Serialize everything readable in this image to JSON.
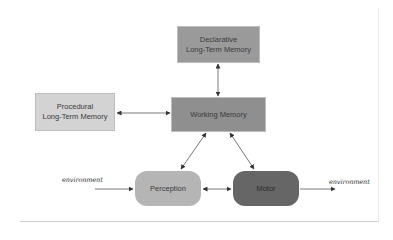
{
  "diagram": {
    "nodes": {
      "declarative": {
        "line1": "Declarative",
        "line2": "Long-Term Memory",
        "color": "#9a9a9a"
      },
      "procedural": {
        "line1": "Procedural",
        "line2": "Long-Term Memory",
        "color": "#d3d3d3"
      },
      "working": {
        "label": "Working Memory",
        "color": "#8f8f8f"
      },
      "perception": {
        "label": "Perception",
        "color": "#b5b5b5"
      },
      "motor": {
        "label": "Motor",
        "color": "#666666"
      }
    },
    "environment_in": "environment",
    "environment_out": "environment",
    "edges": [
      {
        "from": "declarative",
        "to": "working",
        "direction": "both"
      },
      {
        "from": "procedural",
        "to": "working",
        "direction": "both"
      },
      {
        "from": "working",
        "to": "perception",
        "direction": "both"
      },
      {
        "from": "working",
        "to": "motor",
        "direction": "both"
      },
      {
        "from": "perception",
        "to": "motor",
        "direction": "both"
      },
      {
        "from": "environment_in",
        "to": "perception",
        "direction": "forward"
      },
      {
        "from": "motor",
        "to": "environment_out",
        "direction": "forward"
      }
    ]
  }
}
